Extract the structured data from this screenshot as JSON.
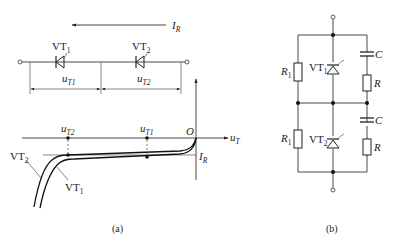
{
  "figure_a": {
    "caption": "(a)",
    "current_label": {
      "main": "I",
      "sub": "R"
    },
    "diodes": [
      {
        "name": "VT",
        "sub": "1"
      },
      {
        "name": "VT",
        "sub": "2"
      }
    ],
    "voltage_labels": [
      {
        "main": "u",
        "sub": "T1"
      },
      {
        "main": "u",
        "sub": "T2"
      }
    ],
    "graph": {
      "origin_label": "O",
      "x_axis_label": {
        "main": "u",
        "sub": "T"
      },
      "current_marker": {
        "main": "I",
        "sub": "R"
      },
      "points": [
        {
          "main": "u",
          "sub": "T2"
        },
        {
          "main": "u",
          "sub": "T1"
        }
      ],
      "curves": [
        {
          "name": "VT",
          "sub": "2"
        },
        {
          "name": "VT",
          "sub": "1"
        }
      ]
    }
  },
  "figure_b": {
    "caption": "(b)",
    "resistors_left": [
      {
        "name": "R",
        "sub": "1"
      },
      {
        "name": "R",
        "sub": "1"
      }
    ],
    "diodes": [
      {
        "name": "VT",
        "sub": "1"
      },
      {
        "name": "VT",
        "sub": "2"
      }
    ],
    "capacitors": [
      "C",
      "C"
    ],
    "resistors_right": [
      "R",
      "R"
    ]
  }
}
